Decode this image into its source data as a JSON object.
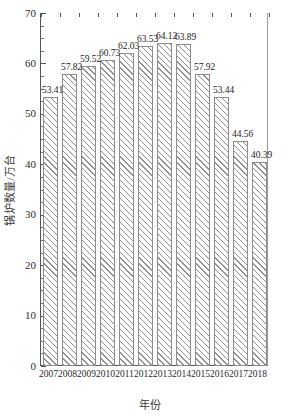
{
  "chart_data": {
    "type": "bar",
    "title": "",
    "xlabel": "年份",
    "ylabel": "锅炉数量/万台",
    "categories": [
      "2007",
      "2008",
      "2009",
      "2010",
      "2011",
      "2012",
      "2013",
      "2014",
      "2015",
      "2016",
      "2017",
      "2018"
    ],
    "values": [
      53.41,
      57.82,
      59.52,
      60.73,
      62.03,
      63.53,
      64.12,
      63.89,
      57.92,
      53.44,
      44.56,
      40.39
    ],
    "data_labels": [
      "53.41",
      "57.82",
      "59.52",
      "60.73",
      "62.03",
      "63.53",
      "64.12",
      "63.89",
      "57.92",
      "53.44",
      "44.56",
      "40.39"
    ],
    "ylim": [
      0,
      70
    ],
    "ytick_labels": [
      "0",
      "10",
      "20",
      "30",
      "40",
      "50",
      "60",
      "70"
    ],
    "ytick_values": [
      0,
      10,
      20,
      30,
      40,
      50,
      60,
      70
    ],
    "y_minor_step": 2.5,
    "grid": false,
    "legend": null,
    "bar_fill": "#ffffff",
    "bar_hatch": "diagonal-45",
    "bar_edge_color": "#8c8c8c",
    "axis_color": "#555555"
  }
}
